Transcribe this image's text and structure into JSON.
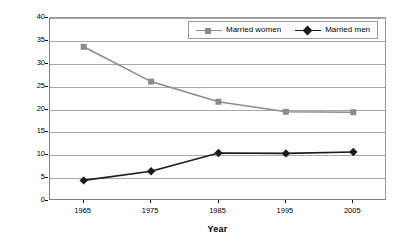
{
  "chart_data": {
    "type": "line",
    "title": "",
    "xlabel": "Year",
    "ylabel": "Hours",
    "x": [
      1965,
      1975,
      1985,
      1995,
      2005
    ],
    "categories": [
      "1965",
      "1975",
      "1985",
      "1995",
      "2005"
    ],
    "xlim": [
      1960,
      2010
    ],
    "ylim": [
      0,
      40
    ],
    "ytick_labels": [
      "0",
      "5",
      "10",
      "15",
      "20",
      "25",
      "30",
      "35",
      "40"
    ],
    "ytick_values": [
      0,
      5,
      10,
      15,
      20,
      25,
      30,
      35,
      40
    ],
    "grid": "horizontal",
    "legend_position": "top-right-inside",
    "series": [
      {
        "name": "Married women",
        "color": "#8c8c8c",
        "marker": "square",
        "values": [
          33.7,
          26.1,
          21.7,
          19.5,
          19.4
        ]
      },
      {
        "name": "Married men",
        "color": "#1a1a1a",
        "marker": "diamond",
        "values": [
          4.5,
          6.5,
          10.5,
          10.4,
          10.7
        ]
      }
    ]
  },
  "axes": {
    "y_title": "Hours",
    "x_title": "Year"
  },
  "legend": {
    "items": [
      {
        "label": "Married women"
      },
      {
        "label": "Married men"
      }
    ]
  },
  "colors": {
    "women": "#8c8c8c",
    "men": "#1a1a1a",
    "grid": "#a8a8a8",
    "axis": "#808080",
    "background": "#ffffff"
  }
}
